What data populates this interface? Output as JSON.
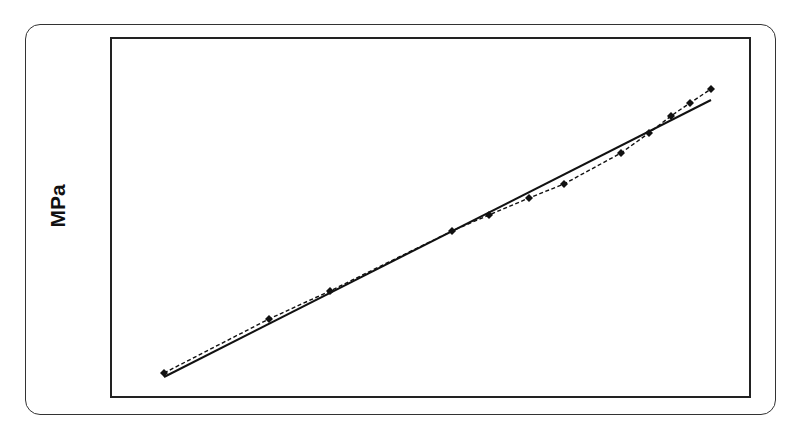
{
  "chart_data": {
    "type": "line",
    "title": "",
    "xlabel": "",
    "ylabel": "MPa",
    "grid": false,
    "legend": null,
    "x_ticks": [],
    "y_ticks": [],
    "series": [
      {
        "name": "measured",
        "style": "dashed",
        "marker": "diamond",
        "color": "#111111",
        "points_px": [
          [
            164,
            373
          ],
          [
            269,
            319
          ],
          [
            330,
            291
          ],
          [
            452,
            231
          ],
          [
            489,
            215
          ],
          [
            529,
            198
          ],
          [
            564,
            184
          ],
          [
            621,
            153
          ],
          [
            649,
            133
          ],
          [
            671,
            116
          ],
          [
            690,
            103
          ],
          [
            711,
            89
          ]
        ]
      },
      {
        "name": "linear-fit",
        "style": "solid",
        "marker": "none",
        "color": "#111111",
        "points_px": [
          [
            164,
            377
          ],
          [
            711,
            100
          ]
        ]
      }
    ],
    "plot_area_px": {
      "left": 111,
      "top": 38,
      "right": 750,
      "bottom": 397
    }
  },
  "labels": {
    "ylabel": "MPa"
  }
}
